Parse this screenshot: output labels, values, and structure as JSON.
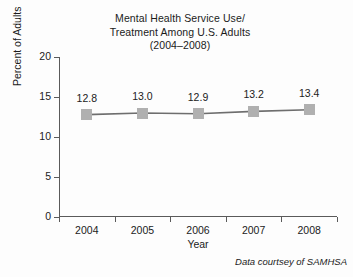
{
  "chart_data": {
    "type": "line",
    "title": "Mental Health Service Use/ Treatment Among U.S. Adults (2004–2008)",
    "title_lines": [
      "Mental Health Service Use/",
      "Treatment Among U.S. Adults",
      "(2004–2008)"
    ],
    "xlabel": "Year",
    "ylabel": "Percent of Adults",
    "categories": [
      "2004",
      "2005",
      "2006",
      "2007",
      "2008"
    ],
    "values": [
      12.8,
      13.0,
      12.9,
      13.2,
      13.4
    ],
    "point_labels": [
      "12.8",
      "13.0",
      "12.9",
      "13.2",
      "13.4"
    ],
    "ylim": [
      0,
      20
    ],
    "yticks": [
      0,
      5,
      10,
      15,
      20
    ],
    "ytick_labels": [
      "0",
      "5",
      "10",
      "15",
      "20"
    ],
    "grid": false,
    "legend": "none",
    "marker": "square",
    "marker_color": "#b0b0b0",
    "line_color": "#6e6e6e",
    "axis_color": "#5a5a5a",
    "annotation": "Data courtsey of SAMHSA"
  }
}
